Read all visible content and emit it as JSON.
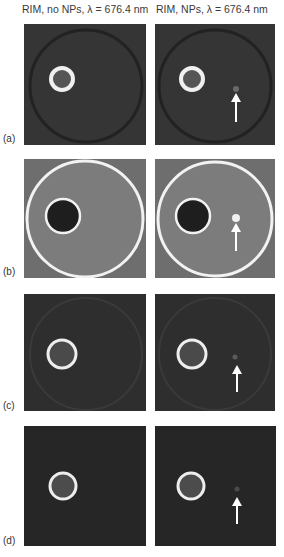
{
  "figure": {
    "columns": [
      {
        "title": "RIM, no NPs, λ = 676.4 nm"
      },
      {
        "title": "RIM, NPs, λ = 676.4 nm"
      }
    ],
    "rows": [
      {
        "label": "(a)",
        "style": "dark-background, bright small ring, faint outer circle",
        "arrow_in_right": true
      },
      {
        "label": "(b)",
        "style": "gray background, bright large outer ring, dark disk with bright rim",
        "arrow_in_right": true
      },
      {
        "label": "(c)",
        "style": "dark background, bright ring, faint outer circle",
        "arrow_in_right": true
      },
      {
        "label": "(d)",
        "style": "dark background, bright ring",
        "arrow_in_right": true
      }
    ],
    "colors": {
      "dark_bg": "#2b2b2b",
      "gray_bg": "#7a7a7a",
      "ring": "#f2f2f2",
      "arrow": "#ffffff"
    }
  }
}
